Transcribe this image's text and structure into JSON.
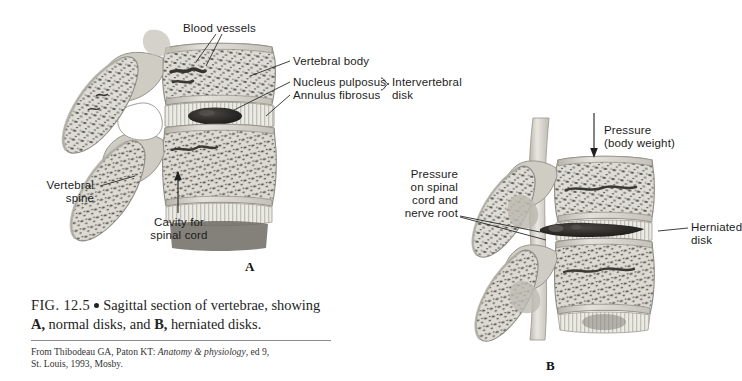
{
  "figure": {
    "caption_number": "FIG. 12.5",
    "caption_text": "Sagittal section of vertebrae, showing",
    "caption_line2_a": "A,",
    "caption_line2_b": " normal disks, and ",
    "caption_line2_c": "B,",
    "caption_line2_d": " herniated disks.",
    "source_line1_plain": "From Thibodeau GA, Paton KT: ",
    "source_line1_italic": "Anatomy & physiology",
    "source_line1_tail": ", ed 9,",
    "source_line2": "St. Louis, 1993, Mosby."
  },
  "panel_a": {
    "letter": "A",
    "labels": {
      "blood_vessels": "Blood vessels",
      "vertebral_body": "Vertebral body",
      "nucleus_pulposus": "Nucleus pulposus",
      "annulus_fibrosus": "Annulus fibrosus",
      "intervertebral_disk_l1": "Intervertebral",
      "intervertebral_disk_l2": "disk",
      "vertebral_spine_l1": "Vertebral",
      "vertebral_spine_l2": "spine",
      "cavity_l1": "Cavity for",
      "cavity_l2": "spinal cord"
    }
  },
  "panel_b": {
    "letter": "B",
    "labels": {
      "pressure_l1": "Pressure",
      "pressure_l2": "(body weight)",
      "spinal_pressure_l1": "Pressure",
      "spinal_pressure_l2": "on spinal",
      "spinal_pressure_l3": "cord and",
      "spinal_pressure_l4": "nerve root",
      "herniated_l1": "Herniated",
      "herniated_l2": "disk"
    }
  },
  "colors": {
    "background": "#ffffff",
    "bone_fill": "#dedcd6",
    "bone_edge": "#9a988f",
    "trabecula": "#4a4842",
    "cortex": "#c9c6bd",
    "nucleus_dark": "#2b2926",
    "disk_pale": "#ecebe6",
    "cord_band": "#d7d5cd",
    "label_text": "#1c1c1c",
    "leader_line": "#2a2a2a"
  }
}
